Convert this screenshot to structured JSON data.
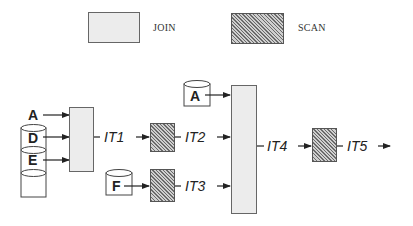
{
  "legend": {
    "join_label": "JOIN",
    "scan_label": "SCAN"
  },
  "colors": {
    "join_fill": "#ececec",
    "scan_fill": "#a8a8a8",
    "stroke": "#333333"
  },
  "inputs": {
    "stack": [
      "A",
      "D",
      "E"
    ],
    "relation_f": "F",
    "relation_a": "A"
  },
  "intermediates": {
    "it1": "IT1",
    "it2": "IT2",
    "it3": "IT3",
    "it4": "IT4",
    "it5": "IT5"
  }
}
